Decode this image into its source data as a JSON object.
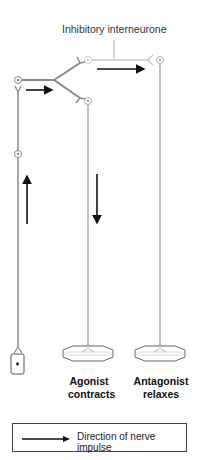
{
  "diagram": {
    "title_label": "Inhibitory interneurone",
    "muscles": [
      {
        "name": "Agonist",
        "state": "contracts"
      },
      {
        "name": "Antagonist",
        "state": "relaxes"
      }
    ],
    "legend": {
      "icon": "arrow-right-icon",
      "label": "Direction of nerve impulse"
    },
    "colors": {
      "neuron": "#8a8a8a",
      "interneurone": "#c8c8c8",
      "arrow": "#111111"
    }
  }
}
